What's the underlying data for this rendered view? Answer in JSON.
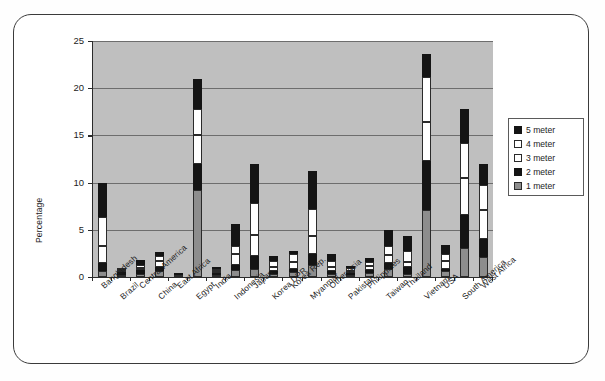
{
  "chart_data": {
    "type": "bar",
    "subtype": "stacked-column",
    "title": "",
    "xlabel": "",
    "ylabel": "Percentage",
    "ylim": [
      0,
      25
    ],
    "yticks": [
      0,
      5,
      10,
      15,
      20,
      25
    ],
    "grid": true,
    "legend_position": "right",
    "categories": [
      "Bangladesh",
      "Brazil",
      "Central America",
      "China",
      "East Africa",
      "Egypt",
      "India",
      "Indonesia",
      "Japan",
      "Korea DPR",
      "Korea Rep.",
      "Myanmar",
      "Other Asia",
      "Pakistan",
      "Philippines",
      "Taiwan",
      "Thailand",
      "Vietnam",
      "USA",
      "South America",
      "West Africa"
    ],
    "series": [
      {
        "name": "1 meter",
        "color": "#8d8d8d",
        "values": [
          0.6,
          0.2,
          0.3,
          0.6,
          0.1,
          9.2,
          0.2,
          0.7,
          0.8,
          0.3,
          0.5,
          1.3,
          0.3,
          0.2,
          0.4,
          0.9,
          0.3,
          7.1,
          0.6,
          3.1,
          2.1
        ]
      },
      {
        "name": "2 meter",
        "color": "#141414",
        "values": [
          0.9,
          0.3,
          0.4,
          0.5,
          0.1,
          2.8,
          0.2,
          0.6,
          1.4,
          0.3,
          0.4,
          1.1,
          0.3,
          0.2,
          0.3,
          0.6,
          0.8,
          5.2,
          0.3,
          3.5,
          1.9
        ]
      },
      {
        "name": "3 meter",
        "color": "#ffffff",
        "values": [
          1.8,
          0.1,
          0.3,
          0.6,
          0.0,
          3.0,
          0.1,
          1.1,
          2.3,
          0.5,
          0.7,
          1.9,
          0.5,
          0.2,
          0.5,
          0.8,
          0.5,
          4.1,
          0.8,
          3.9,
          3.1
        ]
      },
      {
        "name": "4 meter",
        "color": "#ffffff",
        "values": [
          3.1,
          0.1,
          0.3,
          0.5,
          0.0,
          2.8,
          0.1,
          0.9,
          3.3,
          0.6,
          0.8,
          2.9,
          0.6,
          0.3,
          0.4,
          1.0,
          1.2,
          4.8,
          0.7,
          3.7,
          2.7
        ]
      },
      {
        "name": "5 meter",
        "color": "#141414",
        "values": [
          3.6,
          0.0,
          0.5,
          0.4,
          0.0,
          3.2,
          0.1,
          2.3,
          4.2,
          0.5,
          0.4,
          4.0,
          0.7,
          0.2,
          0.4,
          1.7,
          1.6,
          2.4,
          1.0,
          3.6,
          2.2
        ]
      }
    ],
    "totals": [
      10.0,
      0.7,
      1.8,
      2.6,
      0.2,
      21.0,
      0.7,
      5.6,
      12.0,
      2.2,
      2.8,
      11.2,
      2.4,
      1.1,
      2.0,
      5.0,
      4.4,
      23.6,
      3.4,
      17.8,
      12.0
    ]
  },
  "legend": {
    "items": [
      {
        "label": "5 meter"
      },
      {
        "label": "4 meter"
      },
      {
        "label": "3 meter"
      },
      {
        "label": "2 meter"
      },
      {
        "label": "1 meter"
      }
    ]
  },
  "colors": {
    "plot_background": "#bfbfbf",
    "gridline": "#6d6d6d",
    "axis": "#2b2b2b",
    "frame_border": "#3b3b3b",
    "page_background": "#ffffff"
  }
}
